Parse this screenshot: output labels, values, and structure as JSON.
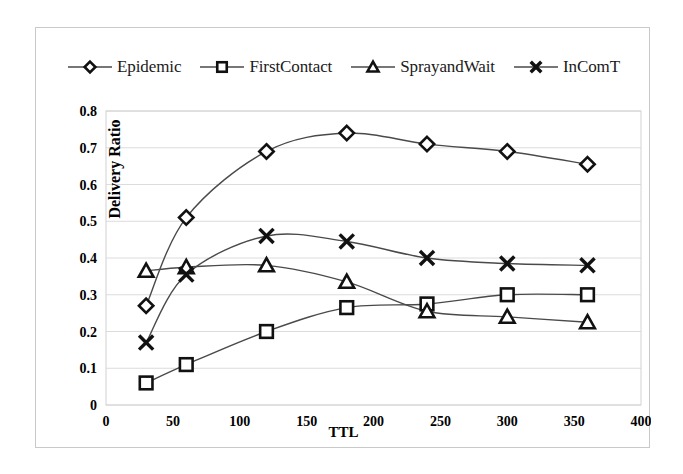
{
  "chart_data": {
    "type": "line",
    "title": "",
    "xlabel": "TTL",
    "ylabel": "Delivery Ratio",
    "xlim": [
      0,
      400
    ],
    "ylim": [
      0,
      0.8
    ],
    "xticks": [
      "0",
      "50",
      "100",
      "150",
      "200",
      "250",
      "300",
      "350",
      "400"
    ],
    "yticks": [
      "0",
      "0.1",
      "0.2",
      "0.3",
      "0.4",
      "0.5",
      "0.6",
      "0.7",
      "0.8"
    ],
    "grid": "horizontal",
    "legend_position": "top",
    "x": [
      30,
      60,
      120,
      180,
      240,
      300,
      360
    ],
    "series": [
      {
        "name": "Epidemic",
        "marker": "diamond",
        "values": [
          0.27,
          0.51,
          0.69,
          0.74,
          0.71,
          0.69,
          0.655
        ]
      },
      {
        "name": "FirstContact",
        "marker": "square",
        "values": [
          0.06,
          0.11,
          0.2,
          0.265,
          0.275,
          0.3,
          0.3
        ]
      },
      {
        "name": "SprayandWait",
        "marker": "triangle",
        "values": [
          0.365,
          0.375,
          0.38,
          0.335,
          0.255,
          0.24,
          0.225
        ]
      },
      {
        "name": "InComT",
        "marker": "cross",
        "values": [
          0.17,
          0.355,
          0.46,
          0.445,
          0.4,
          0.385,
          0.38
        ]
      }
    ]
  },
  "legend": {
    "items": [
      {
        "label": "Epidemic",
        "marker": "diamond"
      },
      {
        "label": "FirstContact",
        "marker": "square"
      },
      {
        "label": "SprayandWait",
        "marker": "triangle"
      },
      {
        "label": "InComT",
        "marker": "cross"
      }
    ]
  },
  "axes": {
    "x_title": "TTL",
    "y_title": "Delivery Ratio"
  }
}
